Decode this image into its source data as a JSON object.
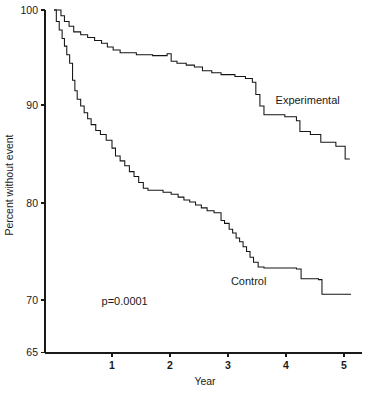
{
  "chart_data": {
    "type": "line",
    "title": "",
    "subtitle": "",
    "xlabel": "Year",
    "ylabel": "Percent without event",
    "xlim": [
      0,
      5.25
    ],
    "ylim": [
      65,
      100
    ],
    "xticks": [
      1,
      2,
      3,
      4,
      5
    ],
    "xtick_labels": [
      "1",
      "2",
      "3",
      "4",
      "5"
    ],
    "yticks": [
      65,
      70,
      80,
      90,
      100
    ],
    "ytick_labels": [
      "65",
      "70",
      "80",
      "90",
      "100"
    ],
    "grid": false,
    "legend_position": "inline-annotation",
    "annotations": [
      {
        "name": "p-value",
        "text": "p=0.0001",
        "x": 0.82,
        "y": 69.5
      },
      {
        "name": "experimental-series-label",
        "text": "Experimental",
        "x": 3.82,
        "y": 90.1
      },
      {
        "name": "control-series-label",
        "text": "Control",
        "x": 3.05,
        "y": 71.5
      }
    ],
    "series": [
      {
        "name": "Experimental",
        "curve_type": "step",
        "points": [
          [
            0.0,
            100.0
          ],
          [
            0.12,
            100.0
          ],
          [
            0.12,
            99.4
          ],
          [
            0.18,
            99.4
          ],
          [
            0.18,
            98.8
          ],
          [
            0.26,
            98.8
          ],
          [
            0.26,
            98.3
          ],
          [
            0.34,
            98.3
          ],
          [
            0.34,
            97.7
          ],
          [
            0.46,
            97.7
          ],
          [
            0.46,
            97.4
          ],
          [
            0.58,
            97.4
          ],
          [
            0.58,
            97.1
          ],
          [
            0.7,
            97.1
          ],
          [
            0.7,
            96.8
          ],
          [
            0.82,
            96.8
          ],
          [
            0.82,
            96.5
          ],
          [
            0.92,
            96.5
          ],
          [
            0.92,
            96.1
          ],
          [
            1.02,
            96.1
          ],
          [
            1.02,
            95.8
          ],
          [
            1.14,
            95.8
          ],
          [
            1.14,
            95.5
          ],
          [
            1.42,
            95.5
          ],
          [
            1.42,
            95.3
          ],
          [
            1.7,
            95.3
          ],
          [
            1.7,
            95.2
          ],
          [
            1.95,
            95.2
          ],
          [
            1.95,
            95.4
          ],
          [
            2.02,
            95.4
          ],
          [
            2.02,
            94.6
          ],
          [
            2.12,
            94.6
          ],
          [
            2.12,
            94.4
          ],
          [
            2.28,
            94.4
          ],
          [
            2.28,
            94.2
          ],
          [
            2.42,
            94.2
          ],
          [
            2.42,
            94.0
          ],
          [
            2.56,
            94.0
          ],
          [
            2.56,
            93.6
          ],
          [
            2.72,
            93.6
          ],
          [
            2.72,
            93.4
          ],
          [
            2.88,
            93.4
          ],
          [
            2.88,
            93.2
          ],
          [
            3.12,
            93.2
          ],
          [
            3.12,
            93.0
          ],
          [
            3.3,
            93.0
          ],
          [
            3.3,
            92.8
          ],
          [
            3.42,
            92.8
          ],
          [
            3.42,
            92.4
          ],
          [
            3.48,
            92.4
          ],
          [
            3.48,
            91.1
          ],
          [
            3.55,
            91.1
          ],
          [
            3.55,
            89.9
          ],
          [
            3.62,
            89.9
          ],
          [
            3.62,
            89.0
          ],
          [
            3.98,
            89.0
          ],
          [
            3.98,
            88.8
          ],
          [
            4.18,
            88.8
          ],
          [
            4.18,
            88.4
          ],
          [
            4.24,
            88.4
          ],
          [
            4.24,
            87.3
          ],
          [
            4.42,
            87.3
          ],
          [
            4.42,
            87.0
          ],
          [
            4.6,
            87.0
          ],
          [
            4.6,
            86.2
          ],
          [
            4.86,
            86.2
          ],
          [
            4.86,
            85.8
          ],
          [
            5.02,
            85.8
          ],
          [
            5.02,
            84.5
          ],
          [
            5.1,
            84.5
          ]
        ]
      },
      {
        "name": "Control",
        "curve_type": "step",
        "points": [
          [
            0.0,
            100.0
          ],
          [
            0.04,
            100.0
          ],
          [
            0.04,
            98.8
          ],
          [
            0.09,
            98.8
          ],
          [
            0.09,
            97.9
          ],
          [
            0.14,
            97.9
          ],
          [
            0.14,
            97.0
          ],
          [
            0.18,
            97.0
          ],
          [
            0.18,
            96.2
          ],
          [
            0.22,
            96.2
          ],
          [
            0.22,
            95.3
          ],
          [
            0.27,
            95.3
          ],
          [
            0.27,
            94.4
          ],
          [
            0.32,
            94.4
          ],
          [
            0.32,
            92.6
          ],
          [
            0.36,
            92.6
          ],
          [
            0.36,
            91.5
          ],
          [
            0.4,
            91.5
          ],
          [
            0.4,
            90.6
          ],
          [
            0.46,
            90.6
          ],
          [
            0.46,
            89.9
          ],
          [
            0.52,
            89.9
          ],
          [
            0.52,
            89.2
          ],
          [
            0.58,
            89.2
          ],
          [
            0.58,
            88.6
          ],
          [
            0.64,
            88.6
          ],
          [
            0.64,
            88.0
          ],
          [
            0.72,
            88.0
          ],
          [
            0.72,
            87.4
          ],
          [
            0.8,
            87.4
          ],
          [
            0.8,
            87.0
          ],
          [
            0.9,
            87.0
          ],
          [
            0.9,
            86.4
          ],
          [
            1.0,
            86.4
          ],
          [
            1.0,
            85.6
          ],
          [
            1.06,
            85.6
          ],
          [
            1.06,
            84.8
          ],
          [
            1.14,
            84.8
          ],
          [
            1.14,
            84.3
          ],
          [
            1.22,
            84.3
          ],
          [
            1.22,
            83.8
          ],
          [
            1.3,
            83.8
          ],
          [
            1.3,
            83.2
          ],
          [
            1.38,
            83.2
          ],
          [
            1.38,
            82.7
          ],
          [
            1.46,
            82.7
          ],
          [
            1.46,
            82.1
          ],
          [
            1.54,
            82.1
          ],
          [
            1.54,
            81.5
          ],
          [
            1.62,
            81.5
          ],
          [
            1.62,
            81.3
          ],
          [
            1.88,
            81.3
          ],
          [
            1.88,
            81.1
          ],
          [
            2.02,
            81.1
          ],
          [
            2.02,
            80.9
          ],
          [
            2.14,
            80.9
          ],
          [
            2.14,
            80.6
          ],
          [
            2.24,
            80.6
          ],
          [
            2.24,
            80.3
          ],
          [
            2.34,
            80.3
          ],
          [
            2.34,
            80.1
          ],
          [
            2.44,
            80.1
          ],
          [
            2.44,
            79.8
          ],
          [
            2.54,
            79.8
          ],
          [
            2.54,
            79.5
          ],
          [
            2.64,
            79.5
          ],
          [
            2.64,
            79.2
          ],
          [
            2.76,
            79.2
          ],
          [
            2.76,
            79.0
          ],
          [
            2.88,
            79.0
          ],
          [
            2.88,
            78.2
          ],
          [
            2.94,
            78.2
          ],
          [
            2.94,
            77.9
          ],
          [
            3.02,
            77.9
          ],
          [
            3.02,
            77.3
          ],
          [
            3.08,
            77.3
          ],
          [
            3.08,
            76.9
          ],
          [
            3.14,
            76.9
          ],
          [
            3.14,
            76.4
          ],
          [
            3.2,
            76.4
          ],
          [
            3.2,
            76.0
          ],
          [
            3.26,
            76.0
          ],
          [
            3.26,
            75.5
          ],
          [
            3.32,
            75.5
          ],
          [
            3.32,
            75.0
          ],
          [
            3.38,
            75.0
          ],
          [
            3.38,
            74.4
          ],
          [
            3.44,
            74.4
          ],
          [
            3.44,
            73.9
          ],
          [
            3.52,
            73.9
          ],
          [
            3.52,
            73.4
          ],
          [
            3.62,
            73.4
          ],
          [
            3.62,
            73.3
          ],
          [
            4.18,
            73.3
          ],
          [
            4.18,
            73.2
          ],
          [
            4.26,
            73.2
          ],
          [
            4.26,
            72.2
          ],
          [
            4.56,
            72.2
          ],
          [
            4.56,
            72.1
          ],
          [
            4.62,
            72.1
          ],
          [
            4.62,
            70.6
          ],
          [
            5.12,
            70.6
          ]
        ]
      }
    ]
  },
  "axes": {
    "x_title": "Year",
    "y_title": "Percent without event"
  }
}
